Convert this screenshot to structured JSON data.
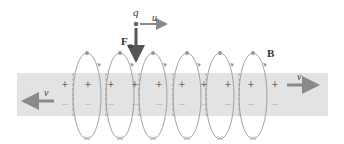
{
  "diagram": {
    "labels": {
      "charge": "q",
      "charge_velocity": "u",
      "force": "F",
      "force_subscript": "B",
      "field": "B",
      "velocity_right": "v",
      "velocity_left": "v"
    },
    "charges": {
      "positive_symbol": "+",
      "negative_symbol": "–",
      "columns": 9
    },
    "loops": 6,
    "colors": {
      "band": "#e3e3e3",
      "arrow": "#8a8a8a",
      "force_arrow": "#555555",
      "loop": "#999999",
      "text": "#333333"
    }
  }
}
